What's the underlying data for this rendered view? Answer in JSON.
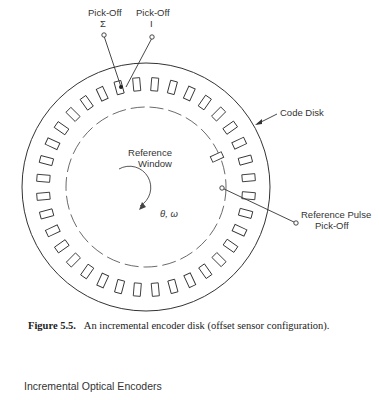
{
  "figure": {
    "labels": {
      "pickoff_sigma_line1": "Pick-Off",
      "pickoff_sigma_line2": "Σ",
      "pickoff_one_line1": "Pick-Off",
      "pickoff_one_line2": "I",
      "code_disk": "Code Disk",
      "reference_window_line1": "Reference",
      "reference_window_line2": "Window",
      "reference_pulse_line1": "Reference Pulse",
      "reference_pulse_line2": "Pick-Off",
      "rotation": "θ, ω"
    },
    "disk": {
      "center_x": 146,
      "center_y": 187,
      "outer_radius": 124,
      "slot_radius": 103,
      "dashed_radius": 80,
      "slot_count": 36,
      "slot_width": 7,
      "slot_height": 13,
      "stroke_color": "#333333"
    }
  },
  "caption": {
    "label": "Figure 5.5.",
    "text": "An incremental encoder disk (offset sensor configuration)."
  },
  "section": {
    "title": "Incremental Optical Encoders"
  }
}
